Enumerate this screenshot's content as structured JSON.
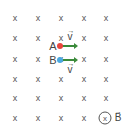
{
  "diagram": {
    "field_symbol": "x",
    "grid": {
      "columns_x": [
        15,
        38,
        61,
        84,
        106
      ],
      "rows_y": [
        18,
        38,
        59,
        79,
        98,
        118
      ]
    },
    "particles": [
      {
        "label": "A",
        "color": "#e8453c",
        "x": 60,
        "y": 46,
        "velocity_label": "v",
        "velocity_label_position": "above"
      },
      {
        "label": "B",
        "color": "#4aa8e0",
        "x": 60,
        "y": 60,
        "velocity_label": "v",
        "velocity_label_position": "below"
      }
    ],
    "arrow_color": "#3a8a3a",
    "legend": {
      "circle_symbol": "x",
      "field_label": "B"
    }
  }
}
